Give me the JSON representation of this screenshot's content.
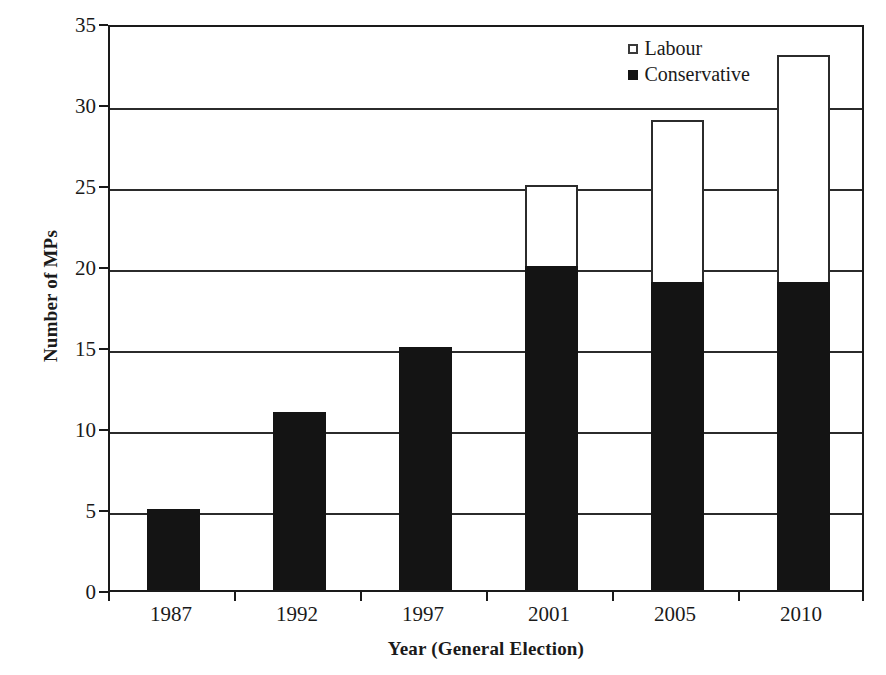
{
  "chart_data": {
    "type": "bar",
    "subtype": "stacked-vertical",
    "title": "",
    "xlabel": "Year (General Election)",
    "ylabel": "Number of MPs",
    "categories": [
      "1987",
      "1992",
      "1997",
      "2001",
      "2005",
      "2010"
    ],
    "series": [
      {
        "name": "Conservative",
        "color": "#141414",
        "values": [
          5,
          11,
          15,
          20,
          19,
          19
        ]
      },
      {
        "name": "Labour",
        "color": "#ffffff",
        "values": [
          0,
          0,
          0,
          5,
          10,
          14
        ]
      }
    ],
    "totals": [
      5,
      11,
      15,
      25,
      29,
      33
    ],
    "ylim": [
      0,
      35
    ],
    "ytick_step": 5,
    "yticks": [
      "0",
      "5",
      "10",
      "15",
      "20",
      "25",
      "30",
      "35"
    ],
    "xticks": [
      "1987",
      "1992",
      "1997",
      "2001",
      "2005",
      "2010"
    ],
    "grid": "horizontal",
    "legend_position": "top-right-inside",
    "legend": [
      {
        "label": "Labour",
        "marker": "open-square"
      },
      {
        "label": "Conservative",
        "marker": "filled-square"
      }
    ]
  }
}
